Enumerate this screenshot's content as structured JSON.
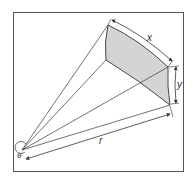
{
  "diagram": {
    "type": "solid-angle-geometry",
    "labels": {
      "x": "x",
      "y": "y",
      "r": "r",
      "theta": "θ"
    },
    "colors": {
      "frame": "#555555",
      "lines": "#333333",
      "patch_fill": "#d4d4d4"
    },
    "elements": [
      "origin-point",
      "projection-rays",
      "curved-surface-patch",
      "dimension-x",
      "dimension-y",
      "dimension-r",
      "angle-theta"
    ]
  }
}
